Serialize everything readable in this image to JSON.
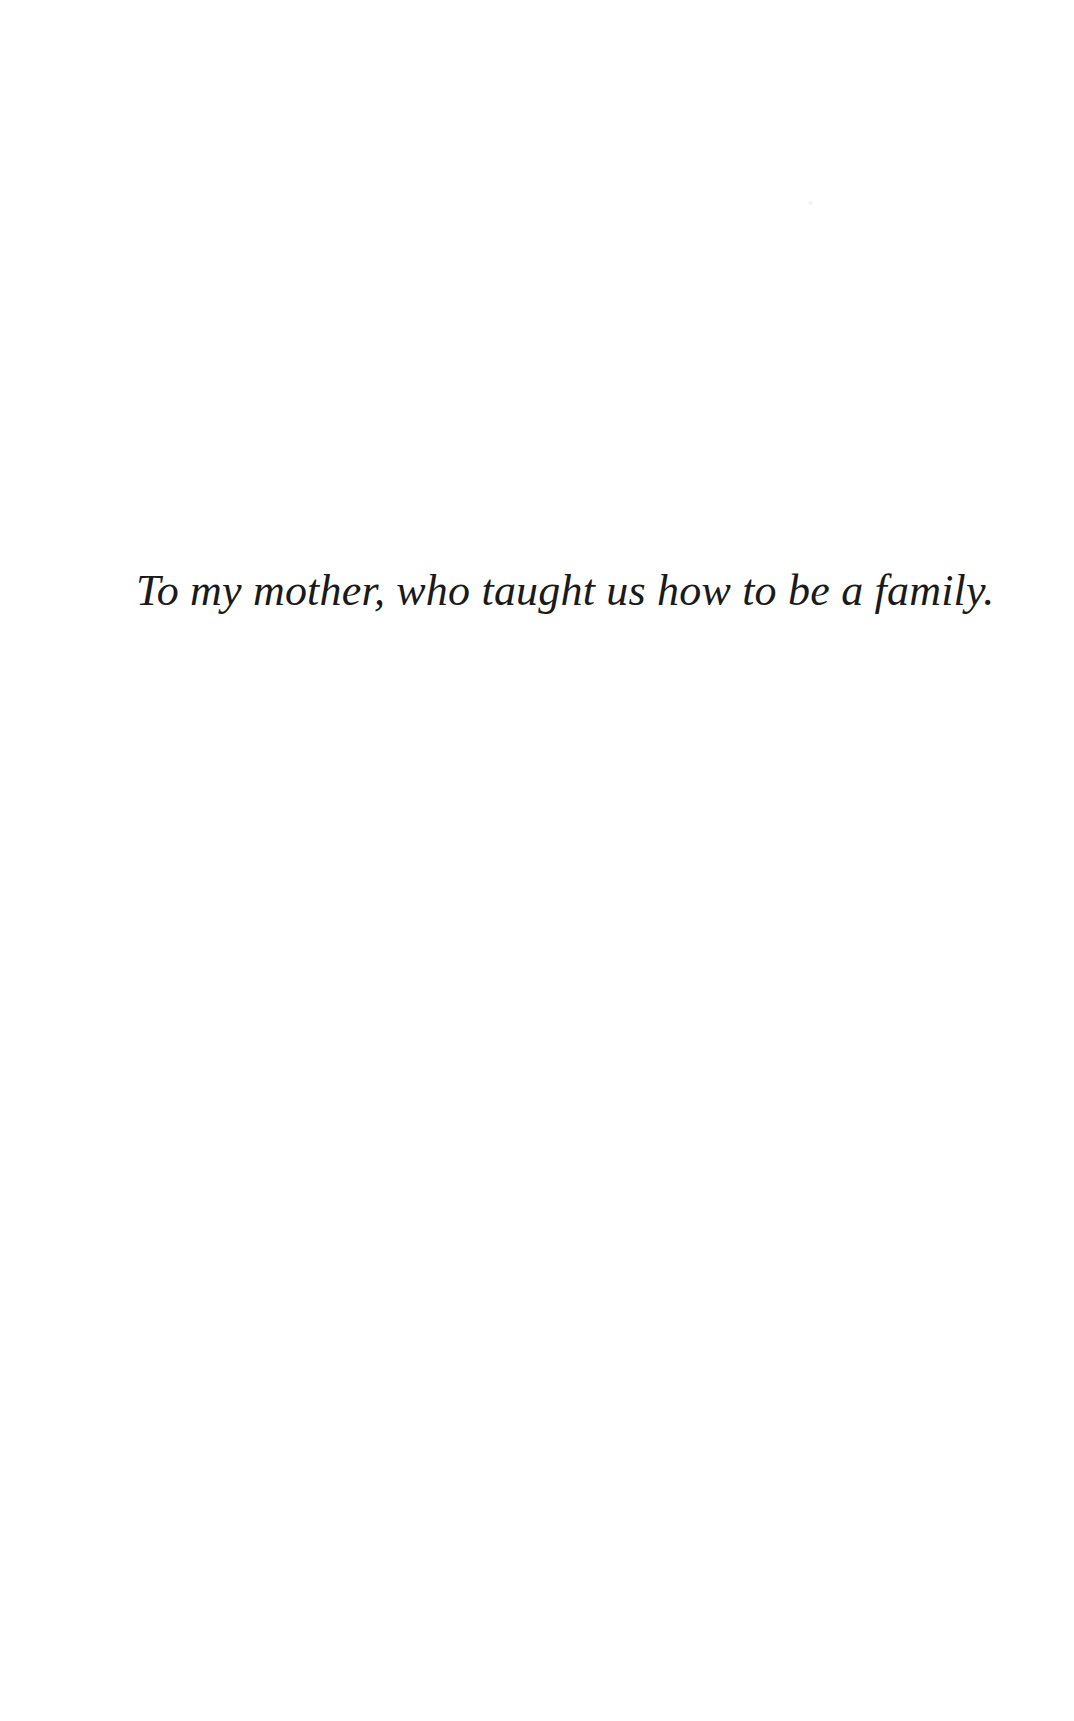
{
  "page": {
    "kind": "book-dedication-page",
    "background_color": "#ffffff",
    "width": 1074,
    "height": 1721
  },
  "dedication": {
    "text": "To my mother, who taught us how to be a family.",
    "style": "italic-serif",
    "color": "#1a1a1a",
    "font_size_px": 44,
    "position": {
      "left_px": 138,
      "baseline_y_px": 565,
      "right_px": 822
    }
  },
  "artifacts": {
    "scan_speck": {
      "name": "scan-speck",
      "color": "#f2f2f2",
      "x_px": 808,
      "y_px": 201
    }
  }
}
